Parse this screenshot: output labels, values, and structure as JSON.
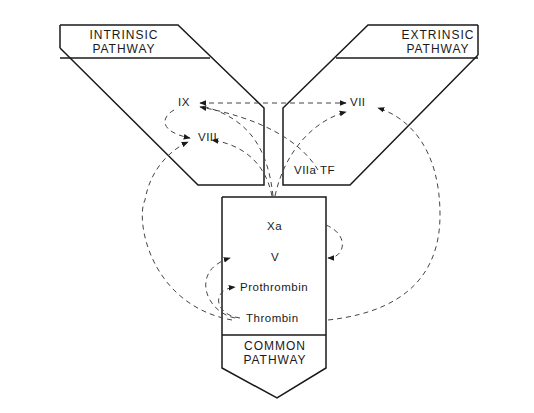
{
  "diagram": {
    "colors": {
      "line": "#1a1a1a",
      "dash": "#555555",
      "background": "#ffffff"
    },
    "pathways": {
      "intrinsic": {
        "line1": "INTRINSIC",
        "line2": "PATHWAY"
      },
      "extrinsic": {
        "line1": "EXTRINSIC",
        "line2": "PATHWAY"
      },
      "common": {
        "line1": "COMMON",
        "line2": "PATHWAY"
      }
    },
    "factors": {
      "ix": "IX",
      "viii": "VIII",
      "vii": "VII",
      "viia_tf": "VIIa TF",
      "xa": "Xa",
      "v": "V",
      "prothrombin": "Prothrombin",
      "thrombin": "Thrombin"
    },
    "edges": [
      {
        "from": "VII",
        "to": "IX",
        "style": "dashed",
        "bidirectional": true
      },
      {
        "from": "IX",
        "to": "VIII",
        "style": "dashed"
      },
      {
        "from": "VIIa TF",
        "to": "IX",
        "style": "dashed"
      },
      {
        "from": "VIIa TF",
        "to": "VII",
        "style": "dashed"
      },
      {
        "from": "Xa",
        "to": "IX",
        "style": "dashed"
      },
      {
        "from": "Thrombin",
        "to": "VIII",
        "style": "dashed"
      },
      {
        "from": "Thrombin",
        "to": "VII",
        "style": "dashed"
      },
      {
        "from": "Xa",
        "to": "V",
        "style": "dashed"
      },
      {
        "from": "Thrombin",
        "to": "V",
        "style": "dashed"
      },
      {
        "from": "Thrombin",
        "to": "Prothrombin",
        "style": "dashed"
      }
    ]
  }
}
